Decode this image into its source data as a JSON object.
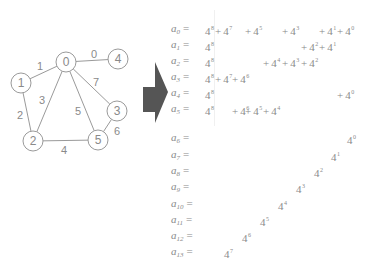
{
  "graph": {
    "nodes": [
      {
        "id": "0",
        "x": 66,
        "y": 62
      },
      {
        "id": "1",
        "x": 21,
        "y": 83
      },
      {
        "id": "2",
        "x": 33,
        "y": 141
      },
      {
        "id": "3",
        "x": 117,
        "y": 111
      },
      {
        "id": "4",
        "x": 118,
        "y": 59
      },
      {
        "id": "5",
        "x": 98,
        "y": 140
      }
    ],
    "edges": [
      {
        "label": "0",
        "from": "0",
        "to": "4",
        "lx": 94,
        "ly": 55
      },
      {
        "label": "1",
        "from": "0",
        "to": "1",
        "lx": 40,
        "ly": 67
      },
      {
        "label": "2",
        "from": "1",
        "to": "2",
        "lx": 20,
        "ly": 116
      },
      {
        "label": "3",
        "from": "0",
        "to": "2",
        "lx": 42,
        "ly": 101
      },
      {
        "label": "4",
        "from": "2",
        "to": "5",
        "lx": 64,
        "ly": 151
      },
      {
        "label": "5",
        "from": "0",
        "to": "5",
        "lx": 78,
        "ly": 112
      },
      {
        "label": "6",
        "from": "3",
        "to": "5",
        "lx": 117,
        "ly": 132
      },
      {
        "label": "7",
        "from": "0",
        "to": "3",
        "lx": 96,
        "ly": 83
      }
    ],
    "node_radius": 10,
    "stroke_color": "#9a9a9a",
    "text_color": "#8a8a8a"
  },
  "arrow": {
    "color": "#555555"
  },
  "equations": {
    "base": "4",
    "label_x": 171,
    "rows": [
      {
        "var": "a",
        "idx": "0",
        "y": 22,
        "terms": [
          {
            "exp": "8",
            "x": 205,
            "lead": true
          },
          {
            "exp": "7",
            "x": 224
          },
          {
            "exp": "5",
            "x": 254
          },
          {
            "exp": "3",
            "x": 291
          },
          {
            "exp": "1",
            "x": 328
          },
          {
            "exp": "0",
            "x": 346
          }
        ]
      },
      {
        "var": "a",
        "idx": "1",
        "y": 38,
        "terms": [
          {
            "exp": "8",
            "x": 205,
            "lead": true
          },
          {
            "exp": "2",
            "x": 310
          },
          {
            "exp": "1",
            "x": 328
          }
        ]
      },
      {
        "var": "a",
        "idx": "2",
        "y": 54,
        "terms": [
          {
            "exp": "8",
            "x": 205,
            "lead": true
          },
          {
            "exp": "4",
            "x": 272
          },
          {
            "exp": "3",
            "x": 291
          },
          {
            "exp": "2",
            "x": 310
          }
        ]
      },
      {
        "var": "a",
        "idx": "3",
        "y": 70,
        "terms": [
          {
            "exp": "8",
            "x": 205,
            "lead": true
          },
          {
            "exp": "7",
            "x": 224
          },
          {
            "exp": "6",
            "x": 241
          }
        ]
      },
      {
        "var": "a",
        "idx": "4",
        "y": 86,
        "terms": [
          {
            "exp": "8",
            "x": 205,
            "lead": true
          },
          {
            "exp": "0",
            "x": 346
          }
        ]
      },
      {
        "var": "a",
        "idx": "5",
        "y": 102,
        "terms": [
          {
            "exp": "8",
            "x": 205,
            "lead": true
          },
          {
            "exp": "6",
            "x": 241
          },
          {
            "exp": "5",
            "x": 254
          },
          {
            "exp": "4",
            "x": 272
          }
        ]
      },
      {
        "var": "a",
        "idx": "6",
        "y": 131,
        "terms": [
          {
            "exp": "0",
            "x": 347,
            "lead": true
          }
        ]
      },
      {
        "var": "a",
        "idx": "7",
        "y": 148,
        "terms": [
          {
            "exp": "1",
            "x": 331,
            "lead": true
          }
        ]
      },
      {
        "var": "a",
        "idx": "8",
        "y": 164,
        "terms": [
          {
            "exp": "2",
            "x": 314,
            "lead": true
          }
        ]
      },
      {
        "var": "a",
        "idx": "9",
        "y": 180,
        "terms": [
          {
            "exp": "3",
            "x": 296,
            "lead": true
          }
        ]
      },
      {
        "var": "a",
        "idx": "10",
        "y": 197,
        "terms": [
          {
            "exp": "4",
            "x": 278,
            "lead": true
          }
        ]
      },
      {
        "var": "a",
        "idx": "11",
        "y": 213,
        "terms": [
          {
            "exp": "5",
            "x": 260,
            "lead": true
          }
        ]
      },
      {
        "var": "a",
        "idx": "12",
        "y": 229,
        "terms": [
          {
            "exp": "6",
            "x": 242,
            "lead": true
          }
        ]
      },
      {
        "var": "a",
        "idx": "13",
        "y": 245,
        "terms": [
          {
            "exp": "7",
            "x": 224,
            "lead": true
          }
        ]
      }
    ]
  }
}
